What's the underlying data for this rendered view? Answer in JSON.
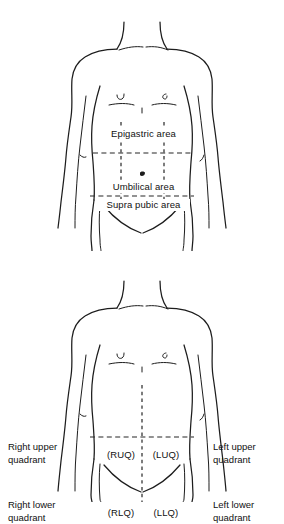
{
  "document": {
    "type": "anatomical-diagram",
    "subject": "Abdominal surface anatomy — regions and quadrants",
    "background_color": "#ffffff",
    "line_color": "#1d1d1d"
  },
  "figures": [
    {
      "id": "abdominal-regions",
      "caption_labels": {
        "epigastric": "Epigastric area",
        "umbilical": "Umbilical area",
        "suprapubic": "Supra pubic area"
      }
    },
    {
      "id": "abdominal-quadrants",
      "labels": {
        "right_upper": "Right upper\nquadrant",
        "right_upper_line1": "Right upper",
        "right_upper_line2": "quadrant",
        "left_upper_line1": "Left upper",
        "left_upper_line2": "quadrant",
        "right_lower_line1": "Right lower",
        "right_lower_line2": "quadrant",
        "left_lower_line1": "Left lower",
        "left_lower_line2": "quadrant",
        "ruq": "(RUQ)",
        "luq": "(LUQ)",
        "rlq": "(RLQ)",
        "llq": "(LLQ)"
      }
    }
  ]
}
